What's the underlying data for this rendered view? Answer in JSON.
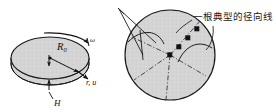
{
  "figure": {
    "caption_top": "",
    "left_diagram": {
      "name": "rotating-disk",
      "labels": {
        "radius": "R",
        "radius_subscript": "0",
        "angular_velocity": "ω",
        "radial_displacement": "r, u",
        "thickness": "H"
      }
    },
    "right_diagram": {
      "name": "disk-cross-section",
      "annotation": "一根典型的径向线",
      "node_count": 4
    },
    "colors": {
      "fill": "#d4d4d4",
      "fill_light": "#dcdcdc",
      "stroke": "#1a1a1a",
      "dash_stroke": "#3a3a3a",
      "text": "#111111",
      "faint_text": "#b9b9b9",
      "background": "#ffffff"
    }
  }
}
